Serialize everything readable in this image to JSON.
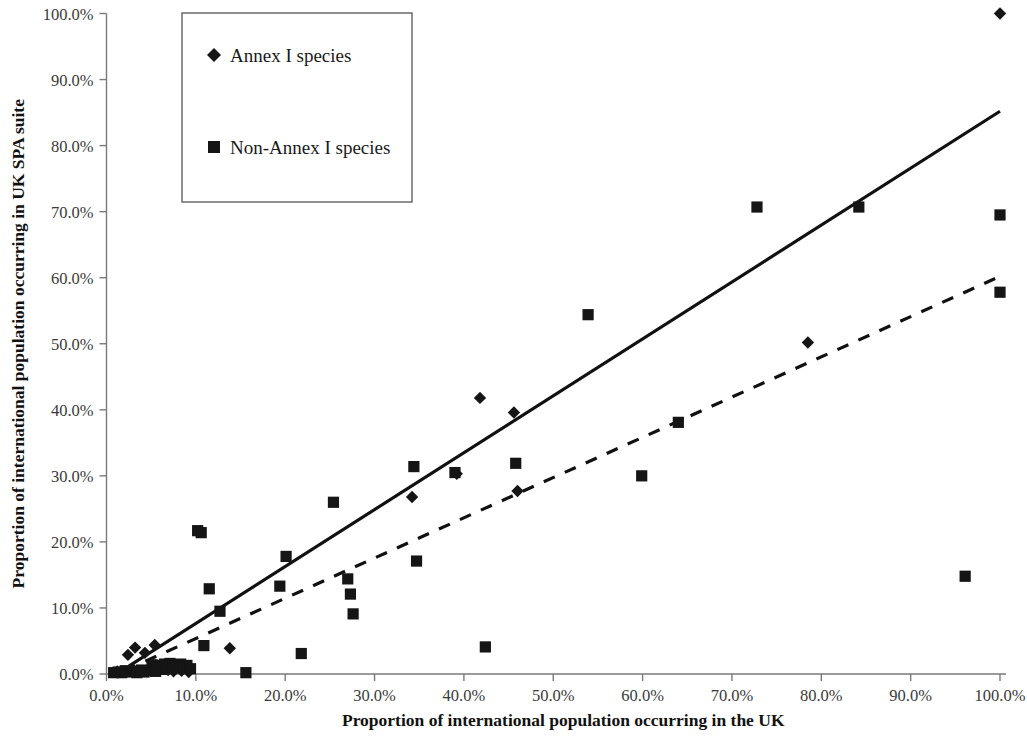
{
  "chart_data": {
    "type": "scatter",
    "title": "",
    "xlabel": "Proportion of international population occurring in the UK",
    "ylabel": "Proportion of international population occurring in UK SPA suite",
    "xlim": [
      0,
      100
    ],
    "ylim": [
      0,
      100
    ],
    "grid": false,
    "legend_position": "top-left",
    "x_ticks": [
      "0.0%",
      "10.0%",
      "20.0%",
      "30.0%",
      "40.0%",
      "50.0%",
      "60.0%",
      "70.0%",
      "80.0%",
      "90.0%",
      "100.0%"
    ],
    "x_tick_values": [
      0,
      10,
      20,
      30,
      40,
      50,
      60,
      70,
      80,
      90,
      100
    ],
    "y_ticks": [
      "0.0%",
      "10.0%",
      "20.0%",
      "30.0%",
      "40.0%",
      "50.0%",
      "60.0%",
      "70.0%",
      "80.0%",
      "90.0%",
      "100.0%"
    ],
    "y_tick_values": [
      0,
      10,
      20,
      30,
      40,
      50,
      60,
      70,
      80,
      90,
      100
    ],
    "series": [
      {
        "name": "Annex I species",
        "marker": "diamond",
        "color": "#151515",
        "points": [
          [
            1.2,
            0.4
          ],
          [
            1.8,
            0.3
          ],
          [
            2.4,
            2.9
          ],
          [
            2.9,
            0.5
          ],
          [
            3.2,
            4.0
          ],
          [
            3.8,
            0.4
          ],
          [
            4.3,
            3.2
          ],
          [
            4.6,
            0.6
          ],
          [
            5.0,
            1.0
          ],
          [
            5.4,
            4.4
          ],
          [
            5.7,
            0.5
          ],
          [
            6.0,
            1.2
          ],
          [
            6.3,
            0.8
          ],
          [
            6.6,
            1.4
          ],
          [
            6.9,
            0.6
          ],
          [
            7.2,
            1.1
          ],
          [
            7.5,
            0.4
          ],
          [
            7.8,
            0.9
          ],
          [
            8.1,
            1.3
          ],
          [
            8.4,
            0.5
          ],
          [
            8.8,
            1.0
          ],
          [
            9.2,
            0.3
          ],
          [
            13.8,
            3.9
          ],
          [
            34.2,
            26.8
          ],
          [
            39.2,
            30.3
          ],
          [
            41.8,
            41.8
          ],
          [
            45.6,
            39.6
          ],
          [
            46.0,
            27.7
          ],
          [
            78.5,
            50.2
          ],
          [
            100.0,
            100.0
          ]
        ]
      },
      {
        "name": "Non-Annex I species",
        "marker": "square",
        "color": "#151515",
        "points": [
          [
            0.8,
            0.2
          ],
          [
            1.3,
            0.3
          ],
          [
            1.7,
            0.2
          ],
          [
            2.1,
            0.5
          ],
          [
            2.6,
            0.3
          ],
          [
            3.0,
            0.4
          ],
          [
            3.4,
            0.2
          ],
          [
            3.9,
            0.6
          ],
          [
            4.2,
            0.3
          ],
          [
            4.7,
            0.5
          ],
          [
            5.1,
            1.4
          ],
          [
            5.5,
            0.4
          ],
          [
            5.9,
            1.3
          ],
          [
            6.2,
            0.7
          ],
          [
            6.5,
            1.5
          ],
          [
            6.8,
            1.1
          ],
          [
            7.1,
            1.6
          ],
          [
            7.4,
            0.9
          ],
          [
            7.7,
            1.4
          ],
          [
            8.0,
            1.2
          ],
          [
            8.3,
            1.5
          ],
          [
            8.6,
            1.0
          ],
          [
            9.0,
            1.3
          ],
          [
            9.4,
            0.8
          ],
          [
            10.2,
            21.7
          ],
          [
            10.6,
            21.4
          ],
          [
            10.9,
            4.3
          ],
          [
            11.5,
            12.9
          ],
          [
            12.7,
            9.5
          ],
          [
            15.6,
            0.2
          ],
          [
            19.4,
            13.3
          ],
          [
            20.1,
            17.8
          ],
          [
            21.8,
            3.1
          ],
          [
            25.4,
            26.0
          ],
          [
            27.0,
            14.4
          ],
          [
            27.3,
            12.1
          ],
          [
            27.6,
            9.1
          ],
          [
            34.4,
            31.4
          ],
          [
            34.7,
            17.1
          ],
          [
            39.0,
            30.5
          ],
          [
            42.4,
            4.1
          ],
          [
            45.8,
            31.9
          ],
          [
            53.9,
            54.4
          ],
          [
            59.9,
            30.0
          ],
          [
            64.0,
            38.1
          ],
          [
            72.8,
            70.7
          ],
          [
            84.2,
            70.7
          ],
          [
            96.1,
            14.8
          ],
          [
            100.0,
            69.5
          ],
          [
            100.0,
            57.8
          ]
        ]
      }
    ],
    "trendlines": [
      {
        "name": "Annex I trendline",
        "style": "solid",
        "x0": 2.5,
        "y0": 1.2,
        "x1": 100.0,
        "y1": 85.2
      },
      {
        "name": "Non-Annex I trendline",
        "style": "dashed",
        "x0": 2.0,
        "y0": 0.5,
        "x1": 100.0,
        "y1": 60.2
      }
    ]
  },
  "legend": {
    "items": [
      {
        "label": "Annex I species",
        "marker": "diamond"
      },
      {
        "label": "Non-Annex I species",
        "marker": "square"
      }
    ]
  }
}
